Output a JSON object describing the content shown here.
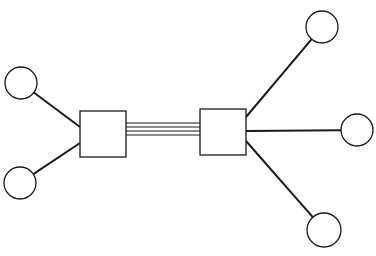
{
  "diagram": {
    "type": "network-topology",
    "stroke_color": "#1a1a1a",
    "background": "#ffffff",
    "hubs": [
      {
        "id": "hub-left",
        "x": 80,
        "y": 111,
        "w": 46,
        "h": 46
      },
      {
        "id": "hub-right",
        "x": 200,
        "y": 109,
        "w": 46,
        "h": 46
      }
    ],
    "trunk": {
      "from": "hub-left",
      "to": "hub-right",
      "x1": 126,
      "x2": 200,
      "line_ys": [
        123,
        127,
        131,
        135
      ],
      "line_count": 4
    },
    "nodes": [
      {
        "id": "node-left-top",
        "cx": 21,
        "cy": 83,
        "r": 16,
        "hub": "hub-left",
        "attach": [
          80,
          127
        ]
      },
      {
        "id": "node-left-bottom",
        "cx": 20,
        "cy": 183,
        "r": 16,
        "hub": "hub-left",
        "attach": [
          80,
          143
        ]
      },
      {
        "id": "node-right-top",
        "cx": 322,
        "cy": 27,
        "r": 16,
        "hub": "hub-right",
        "attach": [
          246,
          117
        ]
      },
      {
        "id": "node-right-middle",
        "cx": 357,
        "cy": 130,
        "r": 16,
        "hub": "hub-right",
        "attach": [
          246,
          131
        ]
      },
      {
        "id": "node-right-bottom",
        "cx": 324,
        "cy": 230,
        "r": 17,
        "hub": "hub-right",
        "attach": [
          246,
          141
        ]
      }
    ]
  }
}
